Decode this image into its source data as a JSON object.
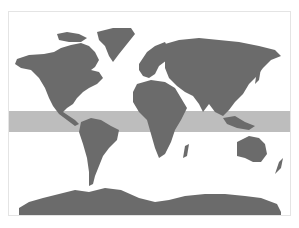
{
  "map": {
    "title": "World map",
    "highlight_band": {
      "label": "Tropics",
      "lat_north": 23.4,
      "lat_south": -23.4
    },
    "colors": {
      "land": "#6b6b6b",
      "band": "#bdbdbd",
      "ocean": "#ffffff",
      "frame": "#e4e4e4"
    },
    "regions": [
      "North America",
      "Greenland",
      "South America",
      "Europe",
      "Africa",
      "Asia",
      "Australia",
      "New Zealand",
      "Antarctica"
    ]
  },
  "caption": ""
}
